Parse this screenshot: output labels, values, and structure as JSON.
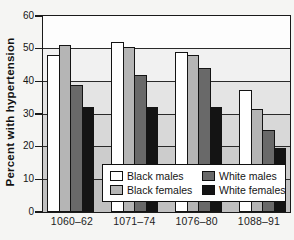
{
  "chart_data": {
    "type": "bar",
    "title": "",
    "ylabel": "Percent with hypertension",
    "xlabel": "",
    "ylim": [
      0,
      60
    ],
    "y_ticks": [
      0,
      10,
      20,
      30,
      40,
      50,
      60
    ],
    "grid": true,
    "legend_position": "inside-bottom",
    "categories": [
      "1060–62",
      "1071–74",
      "1076–80",
      "1088–91"
    ],
    "series": [
      {
        "name": "Black males",
        "color": "#ffffff",
        "values": [
          48,
          52,
          49,
          37.5
        ]
      },
      {
        "name": "Black females",
        "color": "#b5b5b5",
        "values": [
          51,
          50.5,
          48,
          31.5
        ]
      },
      {
        "name": "White males",
        "color": "#696969",
        "values": [
          39,
          42,
          44,
          25
        ]
      },
      {
        "name": "White females",
        "color": "#141414",
        "values": [
          32,
          32,
          32,
          19.5
        ]
      }
    ],
    "bar_outline_color": "#141414",
    "frame_color": "#1a1a1a",
    "plot_background_bands": [
      "#fdfdfd",
      "#f1f1f1",
      "#e4e4e4",
      "#d8d8d8",
      "#cccccc",
      "#c0c0c0"
    ]
  }
}
